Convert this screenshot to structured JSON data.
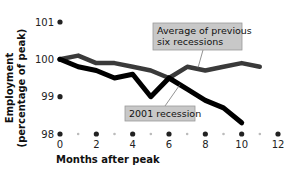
{
  "chart_data": {
    "type": "line",
    "title": "",
    "xlabel": "Months after peak",
    "ylabel": "Employment\n(percentage of peak)",
    "ylabel_lines": [
      "Employment",
      "(percentage of peak)"
    ],
    "xlim": [
      0,
      12
    ],
    "ylim": [
      98,
      101
    ],
    "x_ticks": [
      0,
      2,
      4,
      6,
      8,
      10,
      12
    ],
    "x_tick_labels": [
      "0",
      "2",
      "4",
      "6",
      "8",
      "10",
      "12"
    ],
    "y_ticks": [
      98,
      99,
      100,
      101
    ],
    "y_tick_labels": [
      "98",
      "99",
      "100",
      "101"
    ],
    "grid": false,
    "series": [
      {
        "name": "Average of previous six recessions",
        "label_lines": [
          "Average of previous",
          "six recessions"
        ],
        "color": "#3a3a3a",
        "x": [
          0,
          1,
          2,
          3,
          4,
          5,
          6,
          7,
          8,
          9,
          10,
          11
        ],
        "values": [
          100.0,
          100.1,
          99.9,
          99.9,
          99.8,
          99.7,
          99.5,
          99.8,
          99.7,
          99.8,
          99.9,
          99.8
        ]
      },
      {
        "name": "2001 recession",
        "label_lines": [
          "2001 recession"
        ],
        "color": "#000000",
        "x": [
          0,
          1,
          2,
          3,
          4,
          5,
          6,
          7,
          8,
          9,
          10
        ],
        "values": [
          100.0,
          99.8,
          99.7,
          99.5,
          99.6,
          99.0,
          99.5,
          99.2,
          98.9,
          98.7,
          98.3
        ]
      }
    ],
    "annotations": [
      {
        "text": "Average of previous six recessions",
        "points_to": "Average of previous six recessions",
        "anchor_x": 7,
        "anchor_y": 99.75
      },
      {
        "text": "2001 recession",
        "points_to": "2001 recession",
        "anchor_x": 6.5,
        "anchor_y": 99.35
      }
    ]
  },
  "colors": {
    "callout_fill": "#c8c8c8",
    "callout_border": "#9a9a9a",
    "tick_dot": "#222222",
    "minor_dot": "#bbbbbb"
  }
}
